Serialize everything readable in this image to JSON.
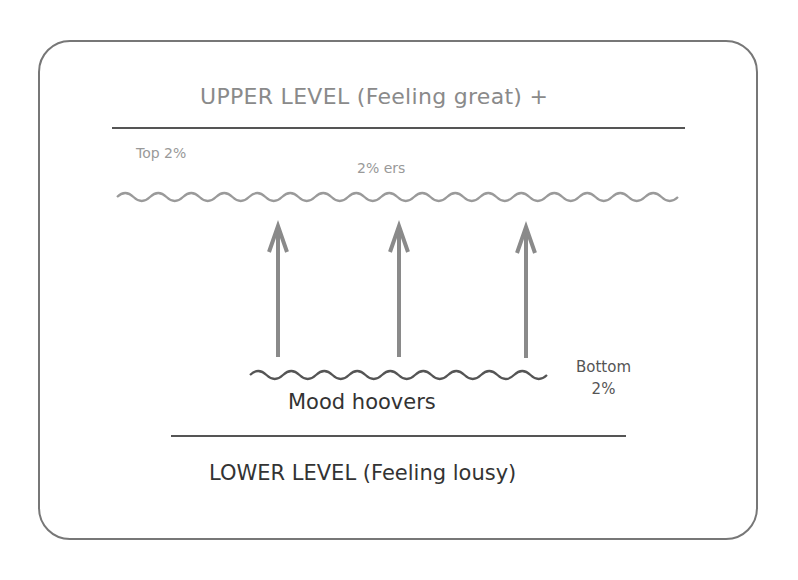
{
  "diagram": {
    "upper_level": {
      "label": "UPPER LEVEL (Feeling great) +"
    },
    "top_group": {
      "tier_label": "Top 2%",
      "group_label": "2% ers"
    },
    "bottom_group": {
      "tier_label_line1": "Bottom",
      "tier_label_line2": "2%",
      "group_label": "Mood hoovers"
    },
    "lower_level": {
      "label": "LOWER LEVEL (Feeling lousy)"
    },
    "arrows": {
      "count": 3,
      "direction": "up",
      "color": "#8a8a8a"
    },
    "colors": {
      "upper_text": "#8a8a8a",
      "lower_text": "#333333",
      "border": "#777777",
      "upper_wave": "#9a9a9a",
      "lower_wave": "#555555"
    }
  }
}
